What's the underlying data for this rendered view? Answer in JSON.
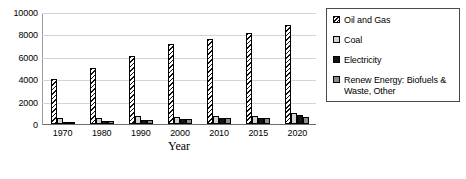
{
  "chart_data": {
    "type": "bar",
    "title": "",
    "xlabel": "Year",
    "ylabel": "",
    "categories": [
      "1970",
      "1980",
      "1990",
      "2000",
      "2010",
      "2015",
      "2020"
    ],
    "ylim": [
      0,
      10000
    ],
    "yticks": [
      0,
      2000,
      4000,
      6000,
      8000,
      10000
    ],
    "ytick_labels": [
      "0",
      "2000",
      "4000",
      "6000",
      "8000",
      "10000"
    ],
    "grid": true,
    "legend_position": "right",
    "series": [
      {
        "name": "Oil and Gas",
        "color": "#ffffff",
        "pattern": "diagonal-hatch",
        "values": [
          4050,
          5000,
          6050,
          7100,
          7600,
          8150,
          8800
        ]
      },
      {
        "name": "Coal",
        "color": "#d3d3d3",
        "pattern": "solid",
        "values": [
          520,
          520,
          700,
          600,
          720,
          760,
          1020
        ]
      },
      {
        "name": "Electricity",
        "color": "#141414",
        "pattern": "solid",
        "values": [
          180,
          280,
          340,
          440,
          520,
          560,
          820
        ]
      },
      {
        "name": "Renew Energy: Biofuels & Waste, Other",
        "color": "#8c8c8c",
        "pattern": "solid",
        "values": [
          200,
          250,
          370,
          470,
          520,
          580,
          640
        ]
      }
    ]
  },
  "legend": {
    "items": [
      {
        "label": "Oil and Gas"
      },
      {
        "label": "Coal"
      },
      {
        "label": "Electricity"
      },
      {
        "label": "Renew Energy: Biofuels  &\nWaste, Other"
      }
    ]
  }
}
